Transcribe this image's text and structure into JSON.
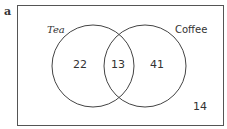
{
  "figure_label": "a",
  "sets": [
    {
      "name": "Tea",
      "only_value": "22"
    },
    {
      "name": "Coffee",
      "only_value": "41"
    }
  ],
  "intersection_value": "13",
  "outside_value": "14",
  "colors": {
    "stroke": "#444444",
    "text": "#333333",
    "background": "#ffffff"
  }
}
